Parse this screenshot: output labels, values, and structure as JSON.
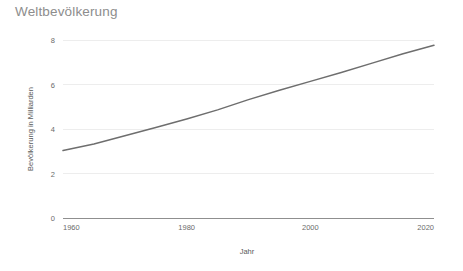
{
  "chart_data": {
    "type": "line",
    "title": "Weltbevölkerung",
    "xlabel": "Jahr",
    "ylabel": "Bevölkerung in Milliarden",
    "xlim": [
      1960,
      2020
    ],
    "ylim": [
      0,
      8
    ],
    "xticks": [
      "1960",
      "1980",
      "2000",
      "2020"
    ],
    "xtick_values": [
      1960,
      1980,
      2000,
      2020
    ],
    "yticks": [
      "0",
      "2",
      "4",
      "6",
      "8"
    ],
    "ytick_values": [
      0,
      2,
      4,
      6,
      8
    ],
    "grid": true,
    "legend": null,
    "series": [
      {
        "name": "Weltbevölkerung",
        "color": "#6e6e6e",
        "x": [
          1960,
          1965,
          1970,
          1975,
          1980,
          1985,
          1990,
          1995,
          2000,
          2005,
          2010,
          2015,
          2020
        ],
        "values": [
          3.03,
          3.33,
          3.7,
          4.07,
          4.45,
          4.86,
          5.32,
          5.74,
          6.14,
          6.54,
          6.96,
          7.38,
          7.76
        ]
      }
    ]
  },
  "axis": {
    "y_title": "Bevölkerung in Milliarden",
    "x_title": "Jahr"
  },
  "colors": {
    "line": "#6e6e6e",
    "grid": "#ededed",
    "baseline": "#8f8f8f",
    "title_text": "#8d8d8d",
    "tick_text": "#6b6b6b",
    "background": "#ffffff"
  }
}
